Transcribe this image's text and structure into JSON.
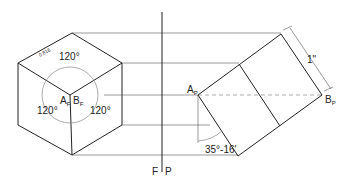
{
  "diagram": {
    "type": "orthographic-isometric-projection",
    "front_view": {
      "angle_top": "120°",
      "angle_left": "120°",
      "angle_right": "120°",
      "point_a": "A",
      "point_a_sub": "F",
      "point_b": "B",
      "point_b_sub": "F",
      "edge_label": "0.816"
    },
    "fold_line": {
      "left": "F",
      "right": "P"
    },
    "profile_view": {
      "point_a": "A",
      "point_a_sub": "P",
      "point_b": "B",
      "point_b_sub": "P",
      "dimension": "1\"",
      "angle": "35°-16′"
    }
  }
}
